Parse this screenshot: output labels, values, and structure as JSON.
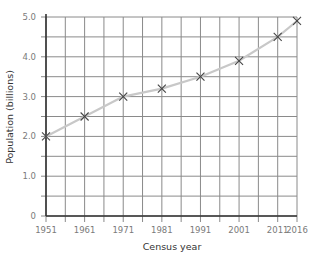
{
  "chart_data": {
    "type": "line",
    "title": "",
    "xlabel": "Census year",
    "ylabel": "Population (billions)",
    "x": [
      1951,
      1961,
      1971,
      1981,
      1991,
      2001,
      2011,
      2016
    ],
    "series": [
      {
        "name": "Population",
        "values": [
          2.0,
          2.5,
          3.0,
          3.2,
          3.5,
          3.9,
          4.5,
          4.9
        ],
        "marker": "x"
      }
    ],
    "xticks": [
      "1951",
      "1961",
      "1971",
      "1981",
      "1991",
      "2001",
      "2011",
      "2016"
    ],
    "yticks": [
      "0",
      "1.0",
      "2.0",
      "3.0",
      "4.0",
      "5.0"
    ],
    "xlim": [
      1951,
      2016
    ],
    "ylim": [
      0,
      5.0
    ],
    "grid": true,
    "grid_x_step_years": 5,
    "grid_y_step": 0.5,
    "legend": null
  },
  "colors": {
    "line": "#c8c8c8",
    "marker": "#444444",
    "grid": "#8a8a8a",
    "axis": "#333333",
    "tick_label": "#7a7a7a",
    "axis_title": "#333333"
  }
}
